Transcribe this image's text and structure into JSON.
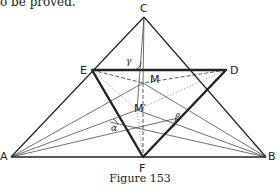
{
  "top_text": "o be proved.",
  "figure_caption": "Figure 153",
  "points": {
    "A": {
      "label": "A",
      "x": 11,
      "y": 157
    },
    "B": {
      "label": "B",
      "x": 266,
      "y": 157
    },
    "C": {
      "label": "C",
      "x": 144,
      "y": 17
    },
    "D": {
      "label": "D",
      "x": 226,
      "y": 70
    },
    "E": {
      "label": "E",
      "x": 92,
      "y": 70
    },
    "F": {
      "label": "F",
      "x": 143,
      "y": 157
    },
    "M": {
      "label": "M",
      "x": 143,
      "y": 83
    },
    "M_prime": {
      "label": "M′",
      "x": 137,
      "y": 110
    }
  },
  "angles": {
    "alpha": "α",
    "beta": "β",
    "gamma": "γ"
  },
  "colors": {
    "ink": "#222222",
    "background": "#ffffff"
  }
}
